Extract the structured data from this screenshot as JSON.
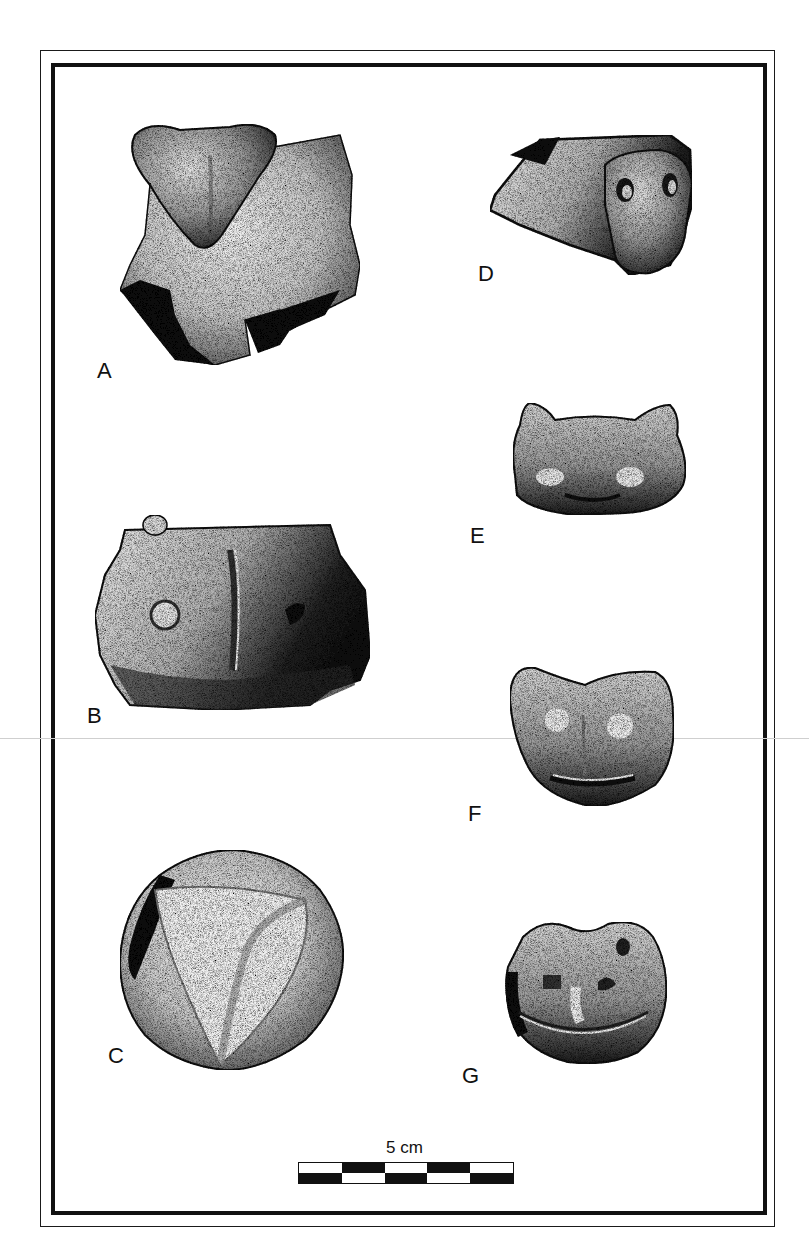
{
  "plate": {
    "frame": {
      "outer_color": "#1a1a1a",
      "inner_color": "#111111"
    },
    "figures": [
      {
        "id": "A",
        "label": "A",
        "description": "vessel rim sherd with triangular appliqué head"
      },
      {
        "id": "B",
        "label": "B",
        "description": "sherd with face: round eye, vertical nose ridge, hollow eye"
      },
      {
        "id": "C",
        "label": "C",
        "description": "round appliqué with triangular ridged face"
      },
      {
        "id": "D",
        "label": "D",
        "description": "side view of zoomorphic head with ear loops"
      },
      {
        "id": "E",
        "label": "E",
        "description": "feline-like head with ears and round eyes"
      },
      {
        "id": "F",
        "label": "F",
        "description": "feline-like head with eyes, nose and mouth"
      },
      {
        "id": "G",
        "label": "G",
        "description": "frog-like head with wide mouth"
      }
    ],
    "scale": {
      "label": "5 cm",
      "segments": 5,
      "top_row": [
        "white",
        "black",
        "white",
        "black",
        "white"
      ],
      "bottom_row": [
        "black",
        "white",
        "black",
        "white",
        "black"
      ]
    }
  }
}
